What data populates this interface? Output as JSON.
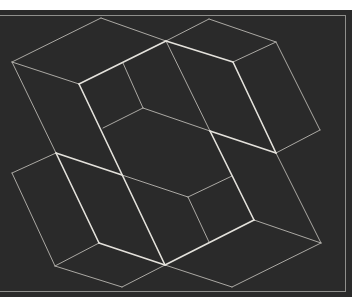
{
  "artwork": {
    "description": "White line constellation on dark board",
    "colors": {
      "background": "#ffffff",
      "board": "#2a2a2a",
      "bold_line": "#e4e2dc",
      "thin_line": "#b9b7b1",
      "frame": "#8f8f8c"
    },
    "board": {
      "x": 0,
      "y": 10,
      "w": 352,
      "h": 287
    },
    "frame": {
      "x": 0,
      "y": 15,
      "w": 346,
      "h": 276
    },
    "bold_edges": [
      [
        79,
        84,
        166,
        41
      ],
      [
        166,
        41,
        233,
        62
      ],
      [
        233,
        62,
        276,
        153
      ],
      [
        210,
        131,
        276,
        153
      ],
      [
        79,
        84,
        165,
        265
      ],
      [
        210,
        131,
        254,
        220
      ],
      [
        56,
        153,
        122,
        175
      ],
      [
        56,
        153,
        99,
        243
      ],
      [
        99,
        243,
        165,
        265
      ],
      [
        165,
        265,
        254,
        220
      ]
    ],
    "thin_edges": [
      [
        101,
        18,
        12,
        62
      ],
      [
        101,
        18,
        166,
        41
      ],
      [
        12,
        62,
        79,
        84
      ],
      [
        12,
        62,
        56,
        153
      ],
      [
        123,
        63,
        143,
        108
      ],
      [
        143,
        108,
        103,
        128
      ],
      [
        143,
        108,
        210,
        131
      ],
      [
        166,
        41,
        210,
        131
      ],
      [
        209,
        19,
        166,
        41
      ],
      [
        209,
        19,
        276,
        42
      ],
      [
        233,
        62,
        276,
        42
      ],
      [
        276,
        42,
        320,
        130
      ],
      [
        320,
        130,
        276,
        153
      ],
      [
        276,
        153,
        321,
        243
      ],
      [
        56,
        153,
        12,
        173
      ],
      [
        12,
        173,
        55,
        266
      ],
      [
        55,
        266,
        99,
        243
      ],
      [
        55,
        266,
        122,
        287
      ],
      [
        122,
        287,
        165,
        265
      ],
      [
        165,
        265,
        232,
        287
      ],
      [
        232,
        287,
        321,
        243
      ],
      [
        254,
        220,
        321,
        243
      ],
      [
        122,
        175,
        188,
        197
      ],
      [
        188,
        197,
        232,
        176
      ],
      [
        188,
        197,
        209,
        242
      ]
    ]
  }
}
